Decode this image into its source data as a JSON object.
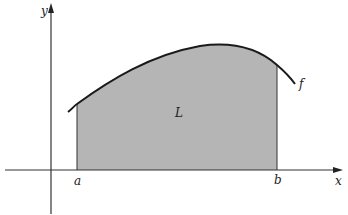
{
  "diagram": {
    "type": "area-under-curve",
    "axes": {
      "x_label": "x",
      "y_label": "y"
    },
    "function_label": "f",
    "region_label": "L",
    "bounds": {
      "lower": "a",
      "upper": "b"
    },
    "colors": {
      "fill": "#b5b5b5",
      "curve": "#1a1a1a",
      "axis": "#333333",
      "background": "#ffffff"
    }
  }
}
